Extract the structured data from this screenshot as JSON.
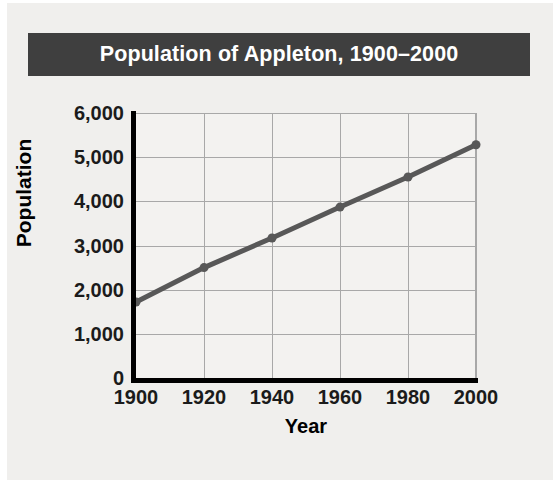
{
  "chart_data": {
    "type": "line",
    "title": "Population of Appleton, 1900–2000",
    "xlabel": "Year",
    "ylabel": "Population",
    "x": [
      1900,
      1920,
      1940,
      1960,
      1980,
      2000
    ],
    "categories": [
      "1900",
      "1920",
      "1940",
      "1960",
      "1980",
      "2000"
    ],
    "values": [
      1720,
      2500,
      3170,
      3870,
      4550,
      5280
    ],
    "series": [
      {
        "name": "Population",
        "values": [
          1720,
          2500,
          3170,
          3870,
          4550,
          5280
        ]
      }
    ],
    "xlim": [
      1900,
      2000
    ],
    "ylim": [
      0,
      6000
    ],
    "xticks": [
      "1900",
      "1920",
      "1940",
      "1960",
      "1980",
      "2000"
    ],
    "yticks": [
      "0",
      "1,000",
      "2,000",
      "3,000",
      "4,000",
      "5,000",
      "6,000"
    ],
    "ytick_values": [
      0,
      1000,
      2000,
      3000,
      4000,
      5000,
      6000
    ],
    "grid": true,
    "legend": false,
    "marker": "circle",
    "colors": {
      "title_band": "#3f3f3f",
      "title_text": "#ffffff",
      "line": "#585858",
      "marker": "#585858",
      "axis": "#000000",
      "gridline": "#a8a8a8",
      "plot_background": "#f3f2f0",
      "figure_background": "#f0efed",
      "tick_label": "#1b1b1b"
    }
  }
}
